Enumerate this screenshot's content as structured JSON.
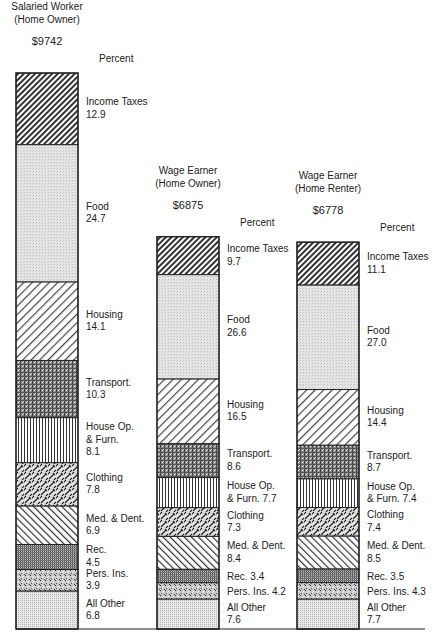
{
  "chart_data": {
    "type": "bar",
    "stacked": true,
    "unit_label": "Percent",
    "title": "",
    "xlabel": "",
    "ylabel": "",
    "grid": false,
    "legend": "inline-right-of-each-bar",
    "categories": [
      "Income Taxes",
      "Food",
      "Housing",
      "Transport.",
      "House Op. & Furn.",
      "Clothing",
      "Med. & Dent.",
      "Rec.",
      "Pers. Ins.",
      "All Other"
    ],
    "series": [
      {
        "name": "Salaried Worker (Home Owner)",
        "title_lines": [
          "Salaried Worker",
          "(Home Owner)"
        ],
        "income": 9742,
        "income_label": "$9742",
        "values": [
          12.9,
          24.7,
          14.1,
          10.3,
          8.1,
          7.8,
          6.9,
          4.5,
          3.9,
          6.8
        ],
        "labels": [
          [
            "Income Taxes",
            "12.9"
          ],
          [
            "Food",
            "24.7"
          ],
          [
            "Housing",
            "14.1"
          ],
          [
            "Transport.",
            "10.3"
          ],
          [
            "House Op.",
            "& Furn.",
            "8.1"
          ],
          [
            "Clothing",
            "7.8"
          ],
          [
            "Med. & Dent.",
            "6.9"
          ],
          [
            "Rec.",
            "4.5"
          ],
          [
            "Pers. Ins.",
            "3.9"
          ],
          [
            "All Other",
            "6.8"
          ]
        ]
      },
      {
        "name": "Wage Earner (Home Owner)",
        "title_lines": [
          "Wage Earner",
          "(Home Owner)"
        ],
        "income": 6875,
        "income_label": "$6875",
        "values": [
          9.7,
          26.6,
          16.5,
          8.6,
          7.7,
          7.3,
          8.4,
          3.4,
          4.2,
          7.6
        ],
        "labels": [
          [
            "Income Taxes",
            "9.7"
          ],
          [
            "Food",
            "26.6"
          ],
          [
            "Housing",
            "16.5"
          ],
          [
            "Transport.",
            "8.6"
          ],
          [
            "House Op.",
            "& Furn.   7.7"
          ],
          [
            "Clothing",
            "7.3"
          ],
          [
            "Med. & Dent.",
            "8.4"
          ],
          [
            "Rec.   3.4"
          ],
          [
            "Pers. Ins.   4.2"
          ],
          [
            "All Other",
            "7.6"
          ]
        ]
      },
      {
        "name": "Wage Earner (Home Renter)",
        "title_lines": [
          "Wage Earner",
          "(Home Renter)"
        ],
        "income": 6778,
        "income_label": "$6778",
        "values": [
          11.1,
          27.0,
          14.4,
          8.7,
          7.4,
          7.4,
          8.5,
          3.5,
          4.3,
          7.7
        ],
        "labels": [
          [
            "Income Taxes",
            "11.1"
          ],
          [
            "Food",
            "27.0"
          ],
          [
            "Housing",
            "14.4"
          ],
          [
            "Transport.",
            "8.7"
          ],
          [
            "House Op.",
            "& Furn.   7.4"
          ],
          [
            "Clothing",
            "7.4"
          ],
          [
            "Med. & Dent.",
            "8.5"
          ],
          [
            "Rec.   3.5"
          ],
          [
            "Pers. Ins.   4.3"
          ],
          [
            "All Other",
            "7.7"
          ]
        ]
      }
    ]
  }
}
